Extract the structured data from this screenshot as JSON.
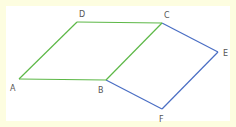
{
  "diagram": {
    "colors": {
      "background_border": "#fdfde0",
      "canvas": "#ffffff",
      "green": "#5db847",
      "blue": "#4a6ec4",
      "label": "#555555"
    },
    "points": {
      "A": {
        "x": 19,
        "y": 79,
        "label": "A",
        "lx": 10,
        "ly": 91
      },
      "B": {
        "x": 106,
        "y": 80,
        "label": "B",
        "lx": 98,
        "ly": 93
      },
      "C": {
        "x": 162,
        "y": 23,
        "label": "C",
        "lx": 164,
        "ly": 18
      },
      "D": {
        "x": 77,
        "y": 22,
        "label": "D",
        "lx": 79,
        "ly": 17
      },
      "E": {
        "x": 218,
        "y": 52,
        "label": "E",
        "lx": 223,
        "ly": 56
      },
      "F": {
        "x": 162,
        "y": 109,
        "label": "F",
        "lx": 159,
        "ly": 122
      }
    },
    "shapes": [
      {
        "name": "parallelogram-ABCD",
        "vertices": [
          "A",
          "B",
          "C",
          "D"
        ],
        "color": "green"
      },
      {
        "name": "parallelogram-BCEF",
        "vertices": [
          "B",
          "C",
          "E",
          "F"
        ],
        "color": "blue"
      }
    ]
  }
}
